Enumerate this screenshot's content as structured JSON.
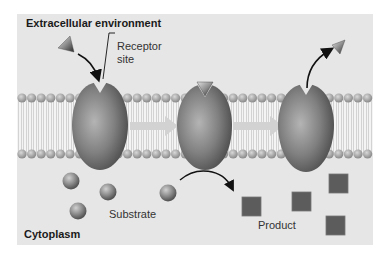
{
  "regions": {
    "top_label": "Extracellular environment",
    "bottom_label": "Cytoplasm"
  },
  "labels": {
    "receptor_site_line1": "Receptor",
    "receptor_site_line2": "site",
    "substrate": "Substrate",
    "product": "Product"
  },
  "stages": [
    {
      "id": "stage-1",
      "description": "Ligand approaches empty receptor site"
    },
    {
      "id": "stage-2",
      "description": "Ligand bound; substrate converted to product"
    },
    {
      "id": "stage-3",
      "description": "Ligand released from receptor"
    }
  ],
  "colors": {
    "background_panel": "#e6e6e6",
    "membrane_head": "#a8a8a8",
    "protein": "#7a7a7a",
    "arrow_fill": "#cfcfcf",
    "product": "#5e5e5e",
    "text": "#222222"
  }
}
